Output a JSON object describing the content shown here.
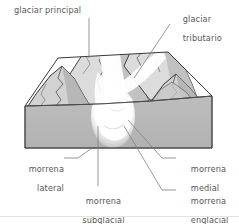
{
  "diagram": {
    "language": "es",
    "type": "block-diagram",
    "colors": {
      "text": "#585858",
      "leader_line": "#7a7a7a",
      "outline": "#3a3a3a",
      "block_face": "#b8b8b8",
      "block_top": "#ffffff",
      "mountain_light": "#e8e8e8",
      "mountain_mid": "#cfcfcf",
      "mountain_dark": "#b0b0b0",
      "glacier_ice": "#ffffff",
      "background": "#ffffff"
    },
    "labels": [
      {
        "id": "glaciar-principal",
        "text_lines": [
          "glaciar principal"
        ],
        "align": "left",
        "x": 14,
        "y": 6
      },
      {
        "id": "glaciar-tributario",
        "text_lines": [
          "glaciar",
          "tributario"
        ],
        "align": "left",
        "x": 172,
        "y": 6
      },
      {
        "id": "morrena-lateral",
        "text_lines": [
          "morrena",
          "lateral"
        ],
        "align": "right",
        "x": 16,
        "y": 156
      },
      {
        "id": "morrena-medial",
        "text_lines": [
          "morrena",
          "medial"
        ],
        "align": "left",
        "x": 165,
        "y": 156
      },
      {
        "id": "morrena-subglacial",
        "text_lines": [
          "morrena",
          "subglacial"
        ],
        "align": "center",
        "x": 56,
        "y": 188
      },
      {
        "id": "morrena-englacial",
        "text_lines": [
          "morrena",
          "englacial"
        ],
        "align": "left",
        "x": 165,
        "y": 188
      }
    ]
  }
}
